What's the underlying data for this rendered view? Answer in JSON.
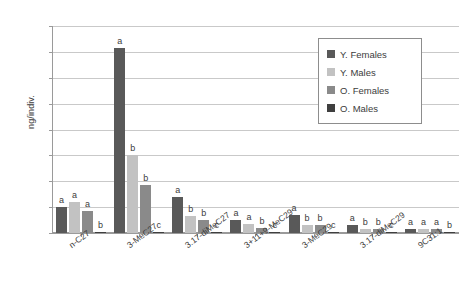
{
  "chart_data": {
    "type": "bar",
    "title": "",
    "xlabel": "",
    "ylabel": "ng/indiv.",
    "ylim": [
      0,
      160
    ],
    "ytick_step": 20,
    "yticks": [
      "160",
      "140",
      "120",
      "100",
      "80",
      "60",
      "40",
      "20",
      "0"
    ],
    "grid": true,
    "legend_position": "top-right",
    "categories": [
      "n-C27",
      "3-MeC27",
      "3.17-diMeC27",
      "3+11+9-MeC29",
      "3-MeC29",
      "3.17-diMeC29",
      "9C31:1"
    ],
    "series": [
      {
        "name": "Y. Females",
        "color": "#595959",
        "values": [
          20,
          143,
          28,
          10,
          14,
          6,
          3
        ],
        "labels": [
          "a",
          "a",
          "a",
          "a",
          "a",
          "a",
          "a"
        ]
      },
      {
        "name": "Y. Males",
        "color": "#c2c2c2",
        "values": [
          24,
          60,
          13,
          7,
          6,
          3,
          3
        ],
        "labels": [
          "a",
          "b",
          "b",
          "a",
          "b",
          "b",
          "a"
        ]
      },
      {
        "name": "O. Females",
        "color": "#8a8a8a",
        "values": [
          17,
          37,
          10,
          4,
          6,
          3,
          3
        ],
        "labels": [
          "a",
          "b",
          "b",
          "b",
          "b",
          "b",
          "a"
        ]
      },
      {
        "name": "O. Males",
        "color": "#3f3f3f",
        "values": [
          1,
          0,
          0,
          0,
          0,
          0,
          0
        ],
        "labels": [
          "b",
          "c",
          "c",
          "c",
          "c",
          "c",
          "b"
        ]
      }
    ]
  },
  "legend": {
    "items": [
      {
        "label": "Y. Females"
      },
      {
        "label": "Y. Males"
      },
      {
        "label": "O. Females"
      },
      {
        "label": "O. Males"
      }
    ]
  }
}
